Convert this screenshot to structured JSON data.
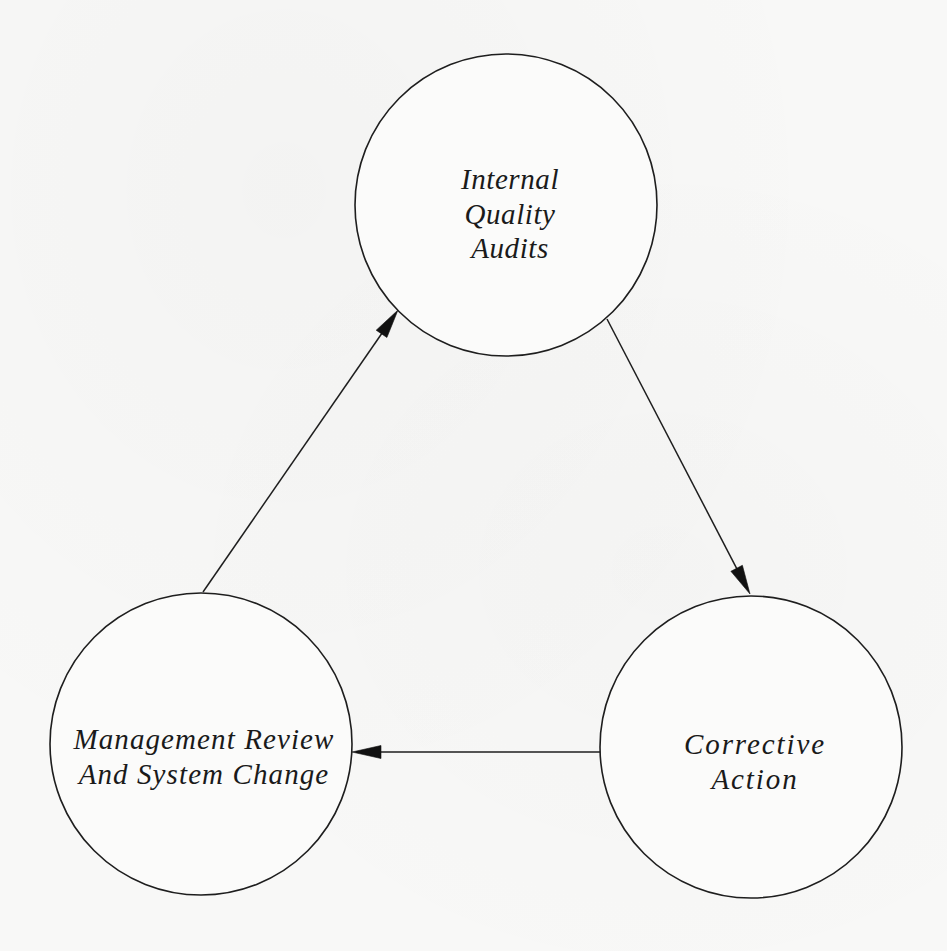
{
  "diagram": {
    "type": "cycle",
    "background": "#f8f8f7",
    "stroke_color": "#1e1e1e",
    "nodes": [
      {
        "id": "internal-quality-audits",
        "lines": [
          "Internal",
          "Quality",
          "Audits"
        ],
        "cx": 506,
        "cy": 205,
        "r": 151
      },
      {
        "id": "corrective-action",
        "lines": [
          "Corrective",
          "Action"
        ],
        "cx": 751,
        "cy": 747,
        "r": 151
      },
      {
        "id": "management-review",
        "lines": [
          "Management Review",
          "And System Change"
        ],
        "cx": 201,
        "cy": 744,
        "r": 151
      }
    ],
    "edges": [
      {
        "from": "management-review",
        "to": "internal-quality-audits",
        "x1": 203,
        "y1": 592,
        "x2": 398,
        "y2": 310
      },
      {
        "from": "internal-quality-audits",
        "to": "corrective-action",
        "x1": 607,
        "y1": 319,
        "x2": 750,
        "y2": 594
      },
      {
        "from": "corrective-action",
        "to": "management-review",
        "x1": 603,
        "y1": 752,
        "x2": 352,
        "y2": 752
      }
    ]
  }
}
